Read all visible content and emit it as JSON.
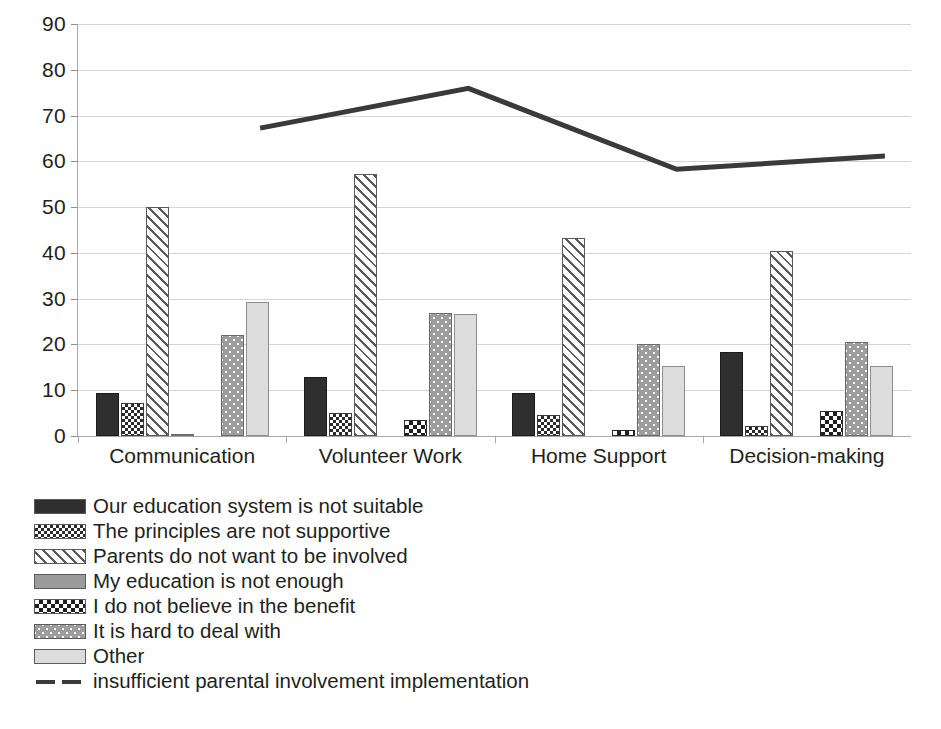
{
  "chart_data": {
    "type": "bar",
    "title": "",
    "subtitle": "",
    "xlabel": "",
    "ylabel": "",
    "ylim": [
      0,
      90
    ],
    "y_ticks": [
      0,
      10,
      20,
      30,
      40,
      50,
      60,
      70,
      80,
      90
    ],
    "grid": true,
    "legend_position": "bottom-left",
    "categories": [
      "Communication",
      "Volunteer Work",
      "Home Support",
      "Decision-making"
    ],
    "series": [
      {
        "name": "Our education system is not suitable",
        "pattern": "solid-dark",
        "values": [
          9.3,
          12.8,
          9.5,
          18.4
        ]
      },
      {
        "name": "The principles are not supportive",
        "pattern": "check-small",
        "values": [
          7.2,
          5.0,
          4.5,
          2.2
        ]
      },
      {
        "name": "Parents do not want to be involved",
        "pattern": "diag-hatch",
        "values": [
          50.1,
          57.2,
          43.3,
          40.5
        ]
      },
      {
        "name": "My education is not enough",
        "pattern": "gray-mid",
        "values": [
          0.5,
          0.0,
          0.0,
          0.0
        ]
      },
      {
        "name": "I do not believe in the benefit",
        "pattern": "check-bold",
        "values": [
          0.0,
          3.4,
          1.3,
          5.5
        ]
      },
      {
        "name": "It is hard to deal with",
        "pattern": "dots-gray",
        "values": [
          22.1,
          26.8,
          20.0,
          20.5
        ]
      },
      {
        "name": "Other",
        "pattern": "light-gray",
        "values": [
          29.2,
          26.7,
          15.3,
          15.3
        ]
      }
    ],
    "line_series": {
      "name": "insufficient parental involvement implementation",
      "values": [
        72.5,
        81.2,
        63.5,
        66.4
      ],
      "color": "#3a3a3a",
      "style": "dashed-thick"
    }
  },
  "legend": {
    "items": [
      {
        "label": "Our education system is not suitable",
        "pattern": "solid-dark"
      },
      {
        "label": "The principles are not supportive",
        "pattern": "check-small"
      },
      {
        "label": "Parents do not want to be involved",
        "pattern": "diag-hatch"
      },
      {
        "label": "My education is not enough",
        "pattern": "gray-mid"
      },
      {
        "label": "I do not believe in the benefit",
        "pattern": "check-bold"
      },
      {
        "label": "It is hard to deal with",
        "pattern": "dots-gray"
      },
      {
        "label": "Other",
        "pattern": "light-gray"
      },
      {
        "label": "insufficient parental involvement implementation",
        "pattern": "line"
      }
    ]
  },
  "colors": {
    "gridline": "#d5d5d5",
    "axis": "#a8a8a8",
    "text": "#231f20",
    "line_series": "#3a3a3a"
  }
}
